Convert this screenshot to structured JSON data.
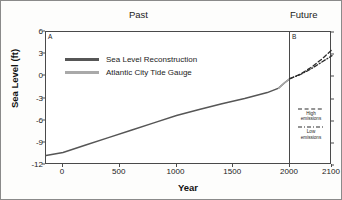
{
  "figure": {
    "past_label": "Past",
    "future_label": "Future",
    "panel_a_letter": "A",
    "panel_b_letter": "B"
  },
  "legend_main": [
    {
      "label": "Sea Level Reconstruction",
      "color": "#565656"
    },
    {
      "label": "Atlantic City Tide Gauge",
      "color": "#a9a9a9"
    }
  ],
  "legend_future": [
    {
      "label_line1": "High",
      "label_line2": "emissions",
      "style": "dashed"
    },
    {
      "label_line1": "Low",
      "label_line2": "emissions",
      "style": "dash-dot"
    }
  ],
  "chart_data": {
    "type": "line",
    "title": "",
    "xlabel": "Year",
    "ylabel": "Sea Level (ft)",
    "ylim": [
      -12,
      6
    ],
    "yticks": [
      6,
      3,
      0,
      -3,
      -6,
      -9,
      -12
    ],
    "ytick_labels": [
      "6",
      "3",
      "0",
      "-3",
      "-6",
      "-9",
      "-12"
    ],
    "panel_a_xlim": [
      -150,
      2000
    ],
    "panel_b_xlim": [
      2000,
      2100
    ],
    "xticks": [
      0,
      500,
      1000,
      1500,
      2000,
      2100
    ],
    "xtick_labels": [
      "0",
      "500",
      "1000",
      "1500",
      "2000",
      "2100"
    ],
    "grid": false,
    "legend_position": "upper-left",
    "series": [
      {
        "name": "Sea Level Reconstruction",
        "color": "#565656",
        "style": "solid",
        "x": [
          -150,
          0,
          200,
          400,
          600,
          800,
          1000,
          1200,
          1400,
          1600,
          1800,
          1900,
          1950,
          2000
        ],
        "y": [
          -10.7,
          -10.3,
          -9.3,
          -8.3,
          -7.3,
          -6.3,
          -5.3,
          -4.5,
          -3.7,
          -3.0,
          -2.2,
          -1.6,
          -0.9,
          -0.3
        ]
      },
      {
        "name": "Atlantic City Tide Gauge",
        "color": "#a9a9a9",
        "style": "solid",
        "x": [
          1900,
          1925,
          1950,
          1975,
          2000
        ],
        "y": [
          -1.6,
          -1.25,
          -0.9,
          -0.6,
          -0.3
        ]
      },
      {
        "name": "High emissions",
        "color": "#2c2c2c",
        "style": "dashed",
        "x": [
          2000,
          2025,
          2050,
          2075,
          2100
        ],
        "y": [
          -0.3,
          0.3,
          1.2,
          2.3,
          3.6
        ]
      },
      {
        "name": "Low emissions",
        "color": "#2c2c2c",
        "style": "dash-dot",
        "x": [
          2000,
          2025,
          2050,
          2075,
          2100
        ],
        "y": [
          -0.3,
          0.25,
          1.0,
          1.9,
          2.8
        ]
      }
    ]
  }
}
